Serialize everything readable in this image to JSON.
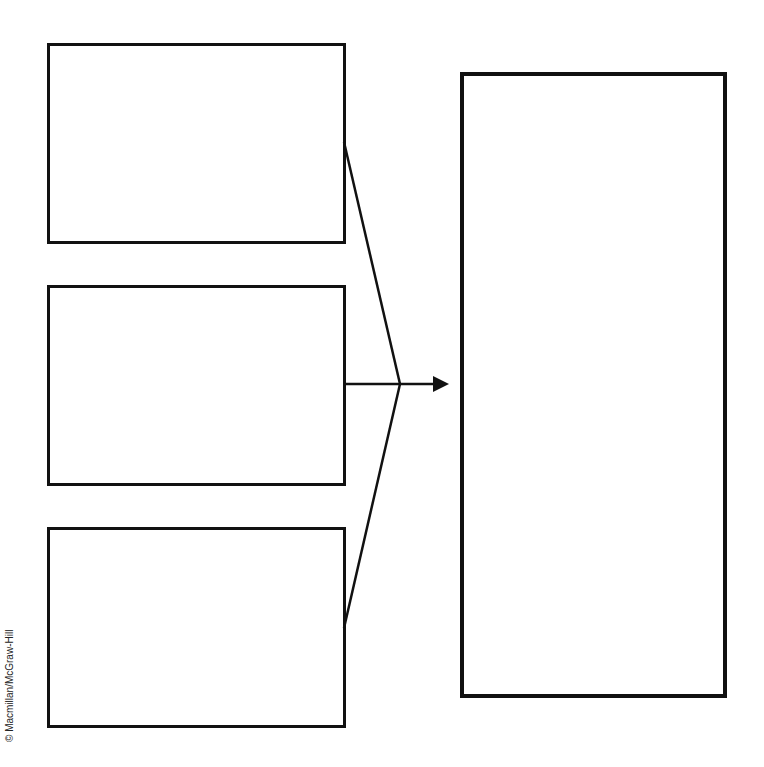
{
  "diagram": {
    "type": "graphic-organizer",
    "input_boxes": [
      {
        "id": "box-1",
        "text": ""
      },
      {
        "id": "box-2",
        "text": ""
      },
      {
        "id": "box-3",
        "text": ""
      }
    ],
    "output_box": {
      "id": "result-box",
      "text": ""
    },
    "connector": {
      "arrow_direction": "right",
      "color": "#111111"
    }
  },
  "footer": {
    "copyright": "© Macmillan/McGraw-Hill"
  }
}
